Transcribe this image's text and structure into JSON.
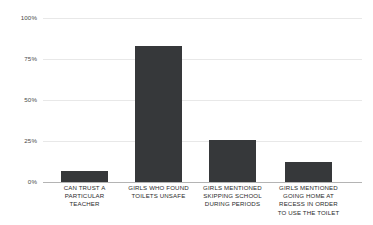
{
  "chart_data": {
    "type": "bar",
    "title": "",
    "subtitle": "",
    "xlabel": "",
    "ylabel": "",
    "ylim": [
      0,
      100
    ],
    "grid": true,
    "legend": false,
    "legend_position": "none",
    "bar_color": "#36383a",
    "gridline_color": "#e8e8e8",
    "axis_color": "#b4b4b4",
    "tick_label_color": "#4a4a4a",
    "category_label_color": "#2b2b2b",
    "yticks": [
      "0%",
      "25%",
      "50%",
      "75%",
      "100%"
    ],
    "ytick_values": [
      0,
      25,
      50,
      75,
      100
    ],
    "categories": [
      "CAN TRUST A\nPARTICULAR\nTEACHER",
      "GIRLS WHO FOUND\nTOILETS UNSAFE",
      "GIRLS MENTIONED\nSKIPPING SCHOOL\nDURING PERIODS",
      "GIRLS MENTIONED\nGOING HOME AT\nRECESS IN ORDER\nTO USE THE TOILET"
    ],
    "values": [
      7,
      83,
      25.5,
      12.5
    ]
  }
}
